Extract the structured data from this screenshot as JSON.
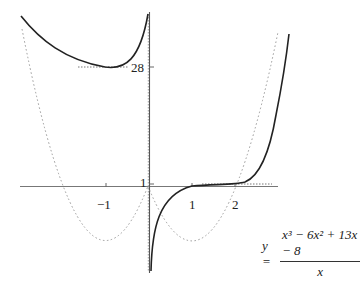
{
  "figure": {
    "equation": {
      "lhs": "y =",
      "numerator": "x³ − 6x² + 13x − 8",
      "denominator": "x"
    },
    "x_ticks": [
      {
        "label": "−1",
        "value": -1
      },
      {
        "label": "1",
        "value": 1
      },
      {
        "label": "2",
        "value": 2
      }
    ],
    "y_ticks": [
      {
        "label": "1",
        "value": 1
      },
      {
        "label": "28",
        "value": 28
      }
    ],
    "curves": [
      {
        "name": "function-curve",
        "style": "solid",
        "color": "#222222"
      },
      {
        "name": "asymptotic-parabola",
        "style": "dotted",
        "color": "#999999"
      },
      {
        "name": "tangent-lines",
        "style": "dotted",
        "color": "#888888"
      }
    ]
  }
}
